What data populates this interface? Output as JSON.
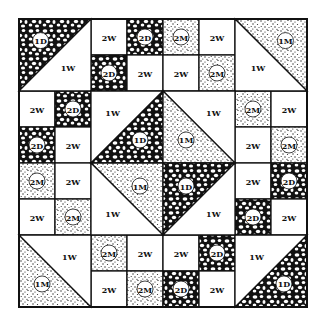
{
  "diagram": {
    "type": "quilt-block",
    "grid_size": 8,
    "origin": 19,
    "cell": 36,
    "colors": {
      "dark": "#111111",
      "medium": "#555555",
      "white": "#ffffff",
      "line": "#111111"
    },
    "legend": {
      "D": "dark fabric (pebble print)",
      "M": "medium fabric (stipple print)",
      "W": "white fabric"
    },
    "squares": [
      {
        "r": 0,
        "c": 2,
        "label": "2W",
        "fabric": "W"
      },
      {
        "r": 0,
        "c": 3,
        "label": "2D",
        "fabric": "D"
      },
      {
        "r": 1,
        "c": 2,
        "label": "2D",
        "fabric": "D"
      },
      {
        "r": 1,
        "c": 3,
        "label": "2W",
        "fabric": "W"
      },
      {
        "r": 0,
        "c": 4,
        "label": "2M",
        "fabric": "M"
      },
      {
        "r": 0,
        "c": 5,
        "label": "2W",
        "fabric": "W"
      },
      {
        "r": 1,
        "c": 4,
        "label": "2W",
        "fabric": "W"
      },
      {
        "r": 1,
        "c": 5,
        "label": "2M",
        "fabric": "M"
      },
      {
        "r": 2,
        "c": 0,
        "label": "2W",
        "fabric": "W"
      },
      {
        "r": 2,
        "c": 1,
        "label": "2D",
        "fabric": "D"
      },
      {
        "r": 3,
        "c": 0,
        "label": "2D",
        "fabric": "D"
      },
      {
        "r": 3,
        "c": 1,
        "label": "2W",
        "fabric": "W"
      },
      {
        "r": 2,
        "c": 6,
        "label": "2M",
        "fabric": "M"
      },
      {
        "r": 2,
        "c": 7,
        "label": "2W",
        "fabric": "W"
      },
      {
        "r": 3,
        "c": 6,
        "label": "2W",
        "fabric": "W"
      },
      {
        "r": 3,
        "c": 7,
        "label": "2M",
        "fabric": "M"
      },
      {
        "r": 4,
        "c": 0,
        "label": "2M",
        "fabric": "M"
      },
      {
        "r": 4,
        "c": 1,
        "label": "2W",
        "fabric": "W"
      },
      {
        "r": 5,
        "c": 0,
        "label": "2W",
        "fabric": "W"
      },
      {
        "r": 5,
        "c": 1,
        "label": "2M",
        "fabric": "M"
      },
      {
        "r": 4,
        "c": 6,
        "label": "2W",
        "fabric": "W"
      },
      {
        "r": 4,
        "c": 7,
        "label": "2D",
        "fabric": "D"
      },
      {
        "r": 5,
        "c": 6,
        "label": "2D",
        "fabric": "D"
      },
      {
        "r": 5,
        "c": 7,
        "label": "2W",
        "fabric": "W"
      },
      {
        "r": 6,
        "c": 2,
        "label": "2M",
        "fabric": "M"
      },
      {
        "r": 6,
        "c": 3,
        "label": "2W",
        "fabric": "W"
      },
      {
        "r": 7,
        "c": 2,
        "label": "2W",
        "fabric": "W"
      },
      {
        "r": 7,
        "c": 3,
        "label": "2M",
        "fabric": "M"
      },
      {
        "r": 6,
        "c": 4,
        "label": "2W",
        "fabric": "W"
      },
      {
        "r": 6,
        "c": 5,
        "label": "2D",
        "fabric": "D"
      },
      {
        "r": 7,
        "c": 4,
        "label": "2D",
        "fabric": "D"
      },
      {
        "r": 7,
        "c": 5,
        "label": "2W",
        "fabric": "W"
      }
    ],
    "corner_triangles": [
      {
        "name": "top-left",
        "r": 0,
        "c": 0,
        "size": 2,
        "diag": "/",
        "fabric_a": "D",
        "label_a": "1D",
        "fabric_b": "W",
        "label_b": "1W"
      },
      {
        "name": "top-right",
        "r": 0,
        "c": 6,
        "size": 2,
        "diag": "\\",
        "fabric_a": "M",
        "label_a": "1M",
        "fabric_b": "W",
        "label_b": "1W"
      },
      {
        "name": "bottom-left",
        "r": 6,
        "c": 0,
        "size": 2,
        "diag": "\\",
        "fabric_a": "M",
        "label_a": "1M",
        "fabric_b": "W",
        "label_b": "1W"
      },
      {
        "name": "bottom-right",
        "r": 6,
        "c": 6,
        "size": 2,
        "diag": "/",
        "fabric_a": "D",
        "label_a": "1D",
        "fabric_b": "W",
        "label_b": "1W"
      }
    ],
    "center_triangles": [
      {
        "name": "center-tl",
        "r": 2,
        "c": 2,
        "size": 2,
        "diag": "/",
        "fabric_a": "W",
        "label_a": "1W",
        "fabric_b": "D",
        "label_b": "1D"
      },
      {
        "name": "center-tr",
        "r": 2,
        "c": 4,
        "size": 2,
        "diag": "\\",
        "fabric_a": "W",
        "label_a": "1W",
        "fabric_b": "M",
        "label_b": "1M"
      },
      {
        "name": "center-bl",
        "r": 4,
        "c": 2,
        "size": 2,
        "diag": "\\",
        "fabric_a": "M",
        "label_a": "1M",
        "fabric_b": "W",
        "label_b": "1W"
      },
      {
        "name": "center-br",
        "r": 4,
        "c": 4,
        "size": 2,
        "diag": "/",
        "fabric_a": "D",
        "label_a": "1D",
        "fabric_b": "W",
        "label_b": "1W"
      }
    ]
  }
}
